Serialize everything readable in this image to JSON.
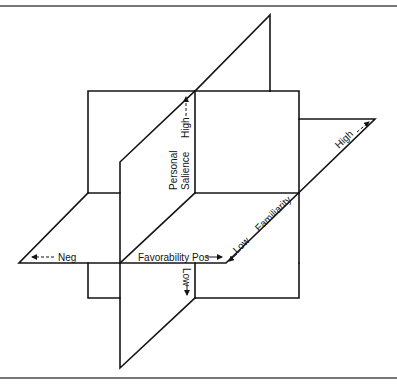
{
  "diagram": {
    "type": "3d-axes-planes",
    "colors": {
      "line": "#141414",
      "frame": "#4a4a4a",
      "background": "#ffffff"
    },
    "axes": {
      "favorability": {
        "name": "Favorability",
        "neg_label": "Neg",
        "pos_label": "Pos"
      },
      "personal_salience": {
        "name_line1": "Personal",
        "name_line2": "Salience",
        "high_label": "High",
        "low_label": "Low"
      },
      "familiarity": {
        "name": "Familiarity",
        "low_label": "Low",
        "high_label": "High"
      }
    }
  }
}
